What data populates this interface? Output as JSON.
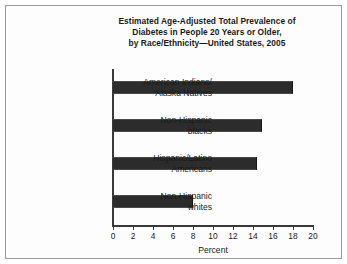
{
  "chart_data": {
    "type": "bar",
    "orientation": "horizontal",
    "title": "Estimated Age-Adjusted Total Prevalence of Diabetes in People 20 Years or Older, by Race/Ethnicity—United States, 2005",
    "title_lines": [
      "Estimated Age-Adjusted Total Prevalence of",
      "Diabetes in People 20 Years or Older,",
      "by Race/Ethnicity—United States, 2005"
    ],
    "categories": [
      "American Indians/ Alaska Natives",
      "Non-Hispanic blacks",
      "Hispanic/Latino Americans",
      "Non-Hispanic whites"
    ],
    "category_lines": [
      [
        "American Indians/",
        "Alaska Natives"
      ],
      [
        "Non-Hispanic",
        "blacks"
      ],
      [
        "Hispanic/Latino",
        "Americans"
      ],
      [
        "Non-Hispanic",
        "whites"
      ]
    ],
    "values": [
      18.0,
      14.9,
      14.4,
      8.0
    ],
    "xlabel": "Percent",
    "ylabel": "",
    "xlim": [
      0,
      20
    ],
    "xticks": [
      0,
      2,
      4,
      6,
      8,
      10,
      12,
      14,
      16,
      18,
      20
    ],
    "xtick_labels": [
      "0",
      "2",
      "4",
      "6",
      "8",
      "10",
      "12",
      "14",
      "16",
      "18",
      "20"
    ],
    "grid": false,
    "legend": false,
    "bar_color": "#2c2c2c",
    "axis_color": "#3a3a3a",
    "text_color": "#1a1a1a",
    "background": "#ffffff",
    "border_color": "#9a9a9a"
  }
}
